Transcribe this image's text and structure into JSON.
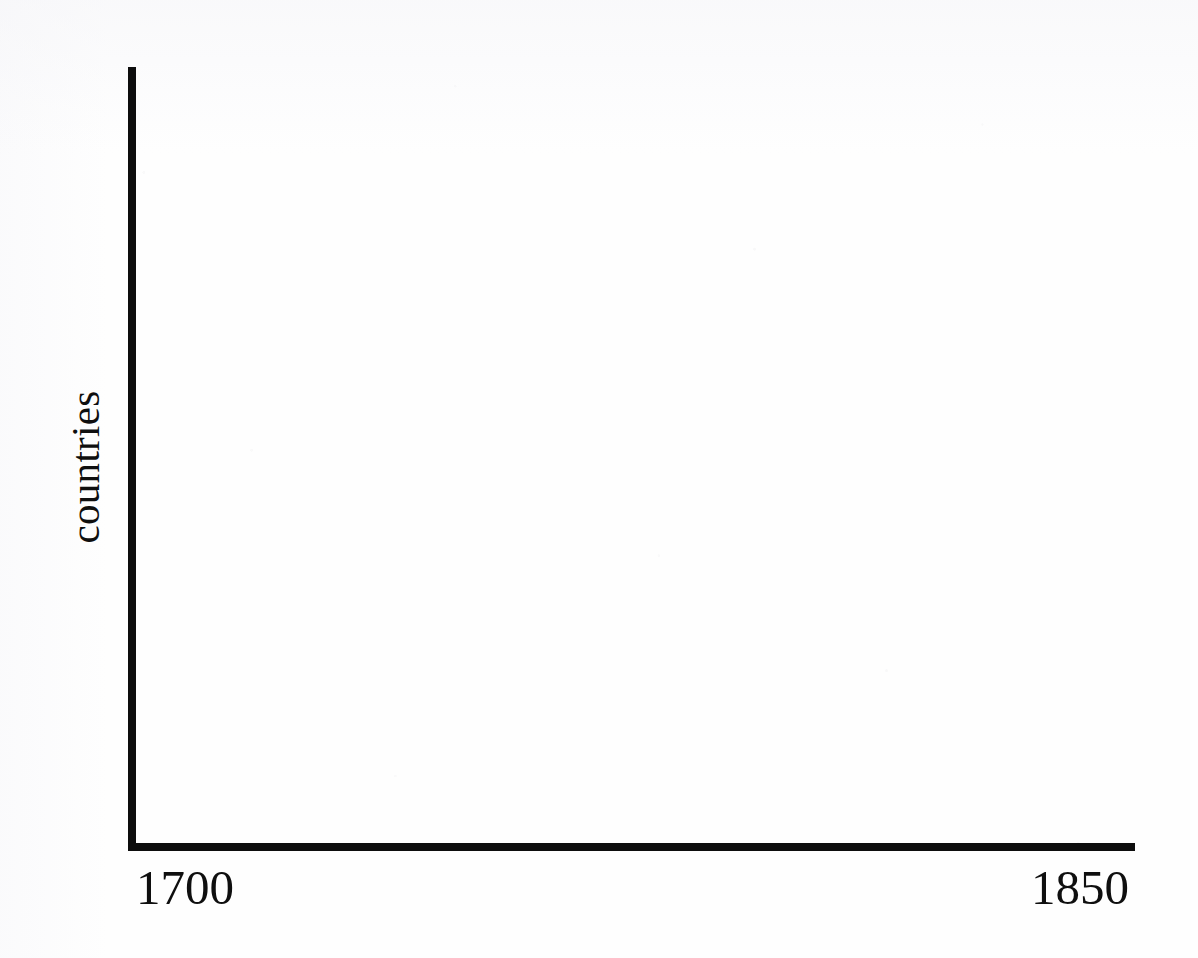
{
  "figure": {
    "background_color": "#fefefe",
    "ink_color": "#0d0d0d"
  },
  "chart_data": {
    "type": "line",
    "title": "",
    "subtitle": "",
    "xlabel": "",
    "ylabel": "countries",
    "x": [],
    "values": [],
    "series": [],
    "categories": [],
    "xtick_labels": [
      "1700",
      "1850"
    ],
    "ytick_labels": [],
    "xlim": [
      1700,
      1850
    ],
    "ylim": [],
    "grid": false,
    "legend": false,
    "legend_position": "none",
    "annotations": [],
    "note": "Empty plot frame: only the L-shaped axes and endpoint labels are drawn; no data series, tick marks, or gridlines are present."
  },
  "axes": {
    "y_axis_label": "countries",
    "x_axis_start_label": "1700",
    "x_axis_end_label": "1850"
  }
}
